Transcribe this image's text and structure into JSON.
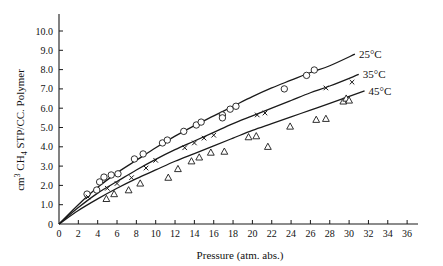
{
  "chart_data": {
    "type": "scatter",
    "title": "",
    "xlabel": "Pressure (atm. abs.)",
    "ylabel": "cm³ CH₄ STP/CC. Polymer",
    "ylabel_parts": {
      "a": "cm",
      "sup": "3",
      "b": " CH",
      "sub": "4",
      "c": " STP/CC. Polymer"
    },
    "xlim": [
      0,
      36
    ],
    "ylim": [
      0,
      10.0
    ],
    "x_ticks": [
      0,
      2,
      4,
      6,
      8,
      10,
      12,
      14,
      16,
      18,
      20,
      22,
      24,
      26,
      28,
      30,
      32,
      34,
      36
    ],
    "y_ticks": [
      "0",
      "1.0",
      "2.0",
      "3.0",
      "4.0",
      "5.0",
      "6.0",
      "7.0",
      "8.0",
      "9.0",
      "10.0"
    ],
    "grid": false,
    "legend": "inline curve labels",
    "series": [
      {
        "name": "25°C",
        "marker": "circle",
        "curve": [
          [
            0,
            0
          ],
          [
            2,
            1.0
          ],
          [
            4,
            1.9
          ],
          [
            6,
            2.65
          ],
          [
            8,
            3.3
          ],
          [
            10,
            3.95
          ],
          [
            12,
            4.55
          ],
          [
            14,
            5.1
          ],
          [
            16,
            5.6
          ],
          [
            18,
            6.1
          ],
          [
            20,
            6.6
          ],
          [
            22,
            7.05
          ],
          [
            24,
            7.45
          ],
          [
            26,
            7.85
          ],
          [
            28,
            8.2
          ],
          [
            30.6,
            8.8
          ]
        ],
        "points": [
          [
            2.9,
            1.55
          ],
          [
            3.9,
            1.76
          ],
          [
            4.2,
            2.18
          ],
          [
            4.65,
            2.43
          ],
          [
            5.4,
            2.54
          ],
          [
            6.1,
            2.6
          ],
          [
            7.8,
            3.37
          ],
          [
            8.7,
            3.63
          ],
          [
            10.7,
            4.2
          ],
          [
            11.2,
            4.35
          ],
          [
            12.9,
            4.8
          ],
          [
            14.2,
            5.13
          ],
          [
            14.7,
            5.28
          ],
          [
            16.9,
            5.65
          ],
          [
            16.9,
            5.5
          ],
          [
            17.7,
            5.95
          ],
          [
            18.3,
            6.1
          ],
          [
            23.3,
            7.0
          ],
          [
            25.6,
            7.7
          ],
          [
            26.4,
            7.98
          ]
        ]
      },
      {
        "name": "35°C",
        "marker": "cross",
        "curve": [
          [
            0,
            0
          ],
          [
            2,
            0.85
          ],
          [
            4,
            1.6
          ],
          [
            6,
            2.2
          ],
          [
            8,
            2.8
          ],
          [
            10,
            3.35
          ],
          [
            12,
            3.85
          ],
          [
            14,
            4.3
          ],
          [
            16,
            4.75
          ],
          [
            18,
            5.2
          ],
          [
            20,
            5.6
          ],
          [
            22,
            6.0
          ],
          [
            24,
            6.4
          ],
          [
            26,
            6.8
          ],
          [
            28,
            7.15
          ],
          [
            31,
            7.75
          ]
        ],
        "points": [
          [
            3,
            1.4
          ],
          [
            5,
            1.85
          ],
          [
            6,
            2.1
          ],
          [
            7.5,
            2.4
          ],
          [
            9,
            2.9
          ],
          [
            10,
            3.3
          ],
          [
            13,
            3.95
          ],
          [
            14,
            4.2
          ],
          [
            15,
            4.45
          ],
          [
            16,
            4.6
          ],
          [
            20.5,
            5.65
          ],
          [
            21.3,
            5.75
          ],
          [
            27.6,
            7.05
          ],
          [
            30.3,
            7.35
          ]
        ]
      },
      {
        "name": "45°C",
        "marker": "triangle",
        "curve": [
          [
            0,
            0
          ],
          [
            2,
            0.7
          ],
          [
            4,
            1.3
          ],
          [
            6,
            1.85
          ],
          [
            8,
            2.35
          ],
          [
            10,
            2.8
          ],
          [
            12,
            3.25
          ],
          [
            14,
            3.65
          ],
          [
            16,
            4.05
          ],
          [
            18,
            4.45
          ],
          [
            20,
            4.85
          ],
          [
            22,
            5.2
          ],
          [
            24,
            5.55
          ],
          [
            26,
            5.9
          ],
          [
            28,
            6.25
          ],
          [
            31.6,
            6.9
          ]
        ],
        "points": [
          [
            4.9,
            1.3
          ],
          [
            5.7,
            1.55
          ],
          [
            7.2,
            1.75
          ],
          [
            8.4,
            2.1
          ],
          [
            11.3,
            2.4
          ],
          [
            12.3,
            2.85
          ],
          [
            13.7,
            3.25
          ],
          [
            14.5,
            3.45
          ],
          [
            15.7,
            3.7
          ],
          [
            17.1,
            3.75
          ],
          [
            19.6,
            4.5
          ],
          [
            20.4,
            4.55
          ],
          [
            21.6,
            4.0
          ],
          [
            23.9,
            5.05
          ],
          [
            26.6,
            5.4
          ],
          [
            27.6,
            5.45
          ],
          [
            29.4,
            6.35
          ],
          [
            29.7,
            6.5
          ],
          [
            30.0,
            6.4
          ]
        ]
      }
    ]
  },
  "colors": {
    "ink": "#1a1a1a",
    "background": "#ffffff"
  }
}
